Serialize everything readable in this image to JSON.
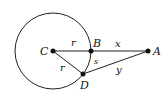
{
  "diagram": {
    "circle": {
      "center": "C",
      "radius_label": "r"
    },
    "points": {
      "C": {
        "label": "C"
      },
      "B": {
        "label": "B"
      },
      "A": {
        "label": "A"
      },
      "D": {
        "label": "D"
      }
    },
    "segments": {
      "CB": {
        "label": "r"
      },
      "CD": {
        "label": "r"
      },
      "BA": {
        "label": "x"
      },
      "DA": {
        "label": "y"
      },
      "arc_BD": {
        "label": "s"
      }
    }
  }
}
